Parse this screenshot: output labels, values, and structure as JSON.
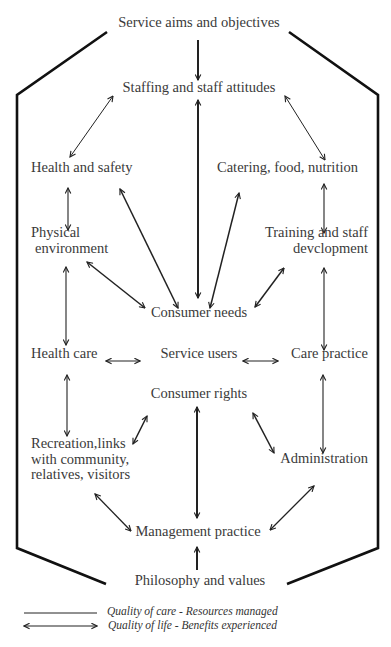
{
  "diagram": {
    "type": "flow-diagram",
    "top": "Service aims and objectives",
    "bottom": "Philosophy and values",
    "nodes": {
      "staffing": "Staffing and staff attitudes",
      "health_safety": "Health and safety",
      "catering": "Catering, food, nutrition",
      "physical_1": "Physical",
      "physical_2": "environment",
      "training_1": "Training and staff",
      "training_2": "devclopment",
      "consumer_needs": "Consumer needs",
      "health_care": "Health care",
      "service_users": "Service users",
      "care_practice": "Care practice",
      "consumer_rights": "Consumer rights",
      "recreation_1": "Recreation,links",
      "recreation_2": "with community,",
      "recreation_3": "relatives, visitors",
      "administration": "Administration",
      "management": "Management practice"
    },
    "edges": [
      {
        "from": "Service aims and objectives",
        "to": "Staffing and staff attitudes",
        "type": "single"
      },
      {
        "from": "Staffing and staff attitudes",
        "to": "Health and safety",
        "type": "double"
      },
      {
        "from": "Staffing and staff attitudes",
        "to": "Catering, food, nutrition",
        "type": "double"
      },
      {
        "from": "Staffing and staff attitudes",
        "to": "Consumer needs",
        "type": "double"
      },
      {
        "from": "Health and safety",
        "to": "Physical environment",
        "type": "double"
      },
      {
        "from": "Health and safety",
        "to": "Consumer needs",
        "type": "double"
      },
      {
        "from": "Catering, food, nutrition",
        "to": "Training and staff devclopment",
        "type": "double"
      },
      {
        "from": "Catering, food, nutrition",
        "to": "Consumer needs",
        "type": "double"
      },
      {
        "from": "Physical environment",
        "to": "Consumer needs",
        "type": "double"
      },
      {
        "from": "Training and staff devclopment",
        "to": "Consumer needs",
        "type": "double"
      },
      {
        "from": "Physical environment",
        "to": "Health care",
        "type": "double"
      },
      {
        "from": "Training and staff devclopment",
        "to": "Care practice",
        "type": "double"
      },
      {
        "from": "Health care",
        "to": "Service users",
        "type": "double"
      },
      {
        "from": "Service users",
        "to": "Care practice",
        "type": "double"
      },
      {
        "from": "Health care",
        "to": "Recreation, links with community, relatives, visitors",
        "type": "double"
      },
      {
        "from": "Care practice",
        "to": "Administration",
        "type": "double"
      },
      {
        "from": "Consumer rights",
        "to": "Recreation, links with community, relatives, visitors",
        "type": "double"
      },
      {
        "from": "Consumer rights",
        "to": "Administration",
        "type": "double"
      },
      {
        "from": "Consumer rights",
        "to": "Management practice",
        "type": "double"
      },
      {
        "from": "Recreation, links with community, relatives, visitors",
        "to": "Management practice",
        "type": "double"
      },
      {
        "from": "Administration",
        "to": "Management practice",
        "type": "double"
      },
      {
        "from": "Philosophy and values",
        "to": "Management practice",
        "type": "single"
      }
    ]
  },
  "legend": {
    "items": [
      {
        "symbol": "line",
        "label": "Quality of care - Resources managed"
      },
      {
        "symbol": "double-arrow",
        "label": "Quality of life - Benefits experienced"
      }
    ]
  }
}
